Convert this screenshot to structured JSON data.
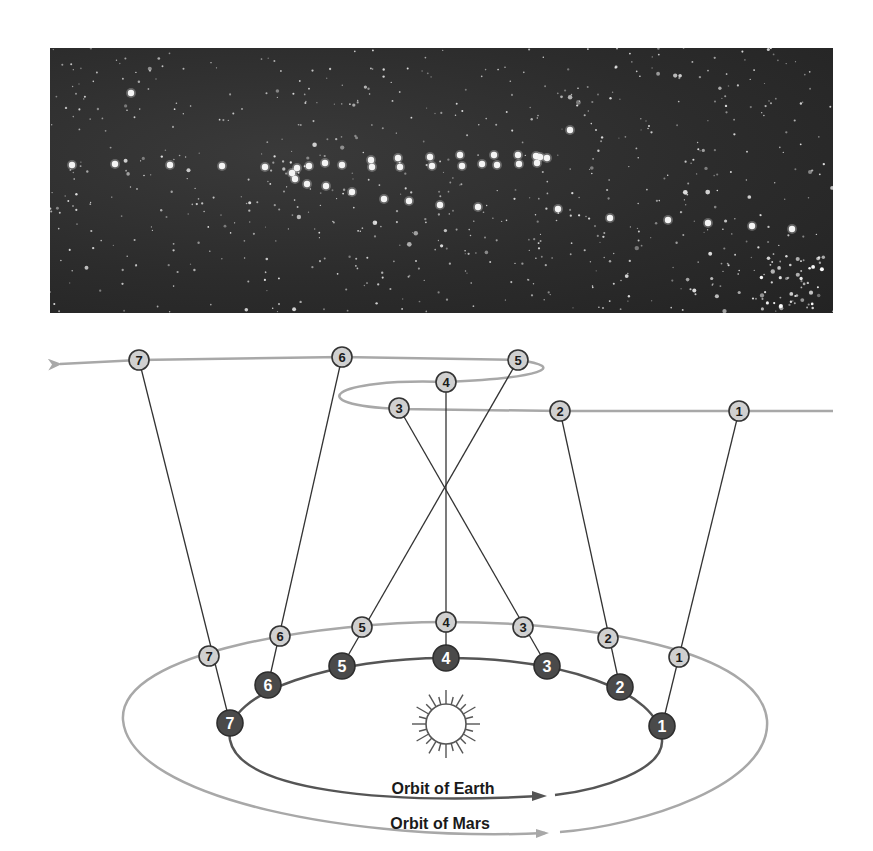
{
  "photo": {
    "label": "Retrograde motion of Mars photographed against the star field",
    "star_count_hint": "background stars",
    "mars_images": [
      [
        72,
        165
      ],
      [
        115,
        164
      ],
      [
        170,
        165
      ],
      [
        222,
        166
      ],
      [
        265,
        167
      ],
      [
        292,
        173
      ],
      [
        297,
        168
      ],
      [
        295,
        179
      ],
      [
        307,
        184
      ],
      [
        309,
        166
      ],
      [
        325,
        163
      ],
      [
        326,
        186
      ],
      [
        342,
        165
      ],
      [
        352,
        192
      ],
      [
        371,
        160
      ],
      [
        372,
        167
      ],
      [
        384,
        199
      ],
      [
        398,
        158
      ],
      [
        400,
        167
      ],
      [
        409,
        201
      ],
      [
        430,
        157
      ],
      [
        432,
        166
      ],
      [
        440,
        205
      ],
      [
        460,
        155
      ],
      [
        462,
        166
      ],
      [
        478,
        207
      ],
      [
        482,
        164
      ],
      [
        494,
        155
      ],
      [
        497,
        165
      ],
      [
        518,
        155
      ],
      [
        519,
        164
      ],
      [
        536,
        156
      ],
      [
        537,
        163
      ],
      [
        540,
        157
      ],
      [
        547,
        158
      ],
      [
        558,
        209
      ],
      [
        610,
        218
      ],
      [
        668,
        220
      ],
      [
        708,
        223
      ],
      [
        752,
        226
      ],
      [
        792,
        229
      ],
      [
        570,
        130
      ],
      [
        131,
        93
      ]
    ]
  },
  "diagram": {
    "sky_positions": [
      {
        "n": "1",
        "x": 739,
        "y": 411
      },
      {
        "n": "2",
        "x": 560,
        "y": 411
      },
      {
        "n": "3",
        "x": 399,
        "y": 408
      },
      {
        "n": "4",
        "x": 446,
        "y": 382
      },
      {
        "n": "5",
        "x": 518,
        "y": 360
      },
      {
        "n": "6",
        "x": 342,
        "y": 357
      },
      {
        "n": "7",
        "x": 139,
        "y": 360
      }
    ],
    "mars_positions": [
      {
        "n": "1",
        "x": 679,
        "y": 657
      },
      {
        "n": "2",
        "x": 608,
        "y": 638
      },
      {
        "n": "3",
        "x": 523,
        "y": 627
      },
      {
        "n": "4",
        "x": 446,
        "y": 622
      },
      {
        "n": "5",
        "x": 362,
        "y": 627
      },
      {
        "n": "6",
        "x": 280,
        "y": 636
      },
      {
        "n": "7",
        "x": 209,
        "y": 656
      }
    ],
    "earth_positions": [
      {
        "n": "1",
        "x": 662,
        "y": 726
      },
      {
        "n": "2",
        "x": 620,
        "y": 687
      },
      {
        "n": "3",
        "x": 547,
        "y": 666
      },
      {
        "n": "4",
        "x": 446,
        "y": 658
      },
      {
        "n": "5",
        "x": 342,
        "y": 666
      },
      {
        "n": "6",
        "x": 268,
        "y": 685
      },
      {
        "n": "7",
        "x": 230,
        "y": 723
      }
    ],
    "labels": {
      "earth_orbit": "Orbit of Earth",
      "mars_orbit": "Orbit of Mars",
      "sun": "Sun"
    },
    "colors": {
      "mars_orbit": "#a8a8a8",
      "earth_orbit": "#555555",
      "earth_marker": "#4a4a4a",
      "mars_marker": "#d0d0d0",
      "sight_line": "#333333",
      "sky_path": "#a8a8a8"
    }
  }
}
